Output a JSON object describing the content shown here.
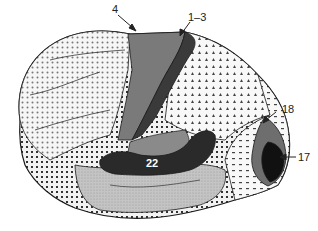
{
  "diagram": {
    "labels": {
      "area_4": "4",
      "area_1_3": "1–3",
      "area_18": "18",
      "area_17": "17",
      "area_22": "22"
    },
    "colors": {
      "background": "#ffffff",
      "outline": "#1a1a1a",
      "area_4_fill": "#7a7a7a",
      "area_1_3_fill": "#3a3a3a",
      "area_17_fill": "#111111",
      "area_18_fill": "#6e6e6e",
      "area_22_fill": "#2a2a2a",
      "auditory_assoc_fill": "#8a8a8a",
      "temporal_fill": "#bdbdbd",
      "pattern_fill": "#f4f4f4"
    }
  }
}
